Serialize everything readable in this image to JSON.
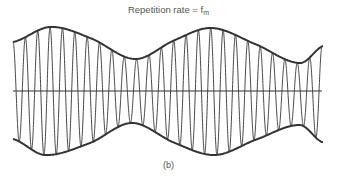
{
  "figure": {
    "title_prefix": "Repetition rate = f",
    "title_subscript": "m",
    "caption": "(b)"
  },
  "chart_data": {
    "type": "line",
    "subtitle": "",
    "caption": "(b)",
    "axis_y_px": 91,
    "x_range_px": [
      13,
      322
    ],
    "carrier_cycles": 25,
    "envelope_top": [
      {
        "x": 13,
        "y": 42
      },
      {
        "x": 50,
        "y": 27
      },
      {
        "x": 90,
        "y": 38
      },
      {
        "x": 135,
        "y": 59
      },
      {
        "x": 175,
        "y": 40
      },
      {
        "x": 212,
        "y": 28
      },
      {
        "x": 255,
        "y": 44
      },
      {
        "x": 300,
        "y": 63
      },
      {
        "x": 323,
        "y": 46
      }
    ],
    "envelope_bottom": [
      {
        "x": 13,
        "y": 139
      },
      {
        "x": 45,
        "y": 155
      },
      {
        "x": 90,
        "y": 143
      },
      {
        "x": 132,
        "y": 123
      },
      {
        "x": 175,
        "y": 143
      },
      {
        "x": 215,
        "y": 155
      },
      {
        "x": 255,
        "y": 140
      },
      {
        "x": 300,
        "y": 125
      },
      {
        "x": 322,
        "y": 142
      }
    ],
    "colors": {
      "line": "#333333",
      "text": "#555555"
    }
  }
}
